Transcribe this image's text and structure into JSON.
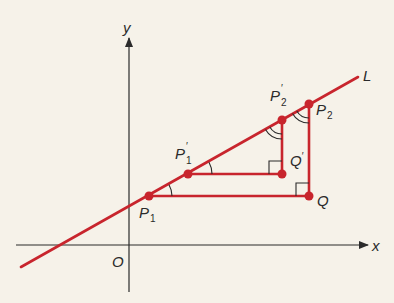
{
  "diagram": {
    "title": "",
    "colors": {
      "background": "#f6f2e9",
      "axis": "#2b2b2b",
      "line": "#c8252d",
      "point": "#c8252d",
      "label": "#2b2b2b"
    },
    "axes": {
      "x_label": "x",
      "y_label": "y",
      "origin_label": "O"
    },
    "line": {
      "label": "L"
    },
    "points": [
      {
        "id": "P1",
        "base": "P",
        "prime": "",
        "sub": "1"
      },
      {
        "id": "P1prime",
        "base": "P",
        "prime": "′",
        "sub": "1"
      },
      {
        "id": "P2prime",
        "base": "P",
        "prime": "′",
        "sub": "2"
      },
      {
        "id": "P2",
        "base": "P",
        "prime": "",
        "sub": "2"
      },
      {
        "id": "Qprime",
        "base": "Q",
        "prime": "′",
        "sub": ""
      },
      {
        "id": "Q",
        "base": "Q",
        "prime": "",
        "sub": ""
      }
    ],
    "triangles": [
      {
        "name": "large",
        "vertices": [
          "P1",
          "Q",
          "P2"
        ],
        "right_angle_at": "Q",
        "angle_mark_at_P1": "single arc",
        "angle_mark_at_P2": "double arc"
      },
      {
        "name": "small",
        "vertices": [
          "P1prime",
          "Qprime",
          "P2prime"
        ],
        "right_angle_at": "Qprime",
        "angle_mark_at_P1prime": "single arc",
        "angle_mark_at_P2prime": "double arc"
      }
    ]
  }
}
